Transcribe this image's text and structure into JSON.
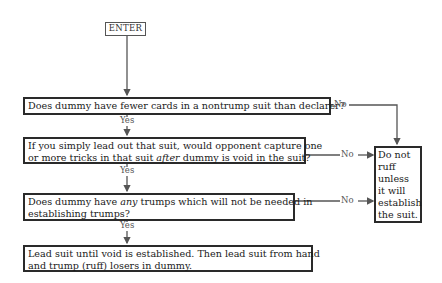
{
  "diagram": {
    "type": "flowchart",
    "start": {
      "label": "ENTER"
    },
    "nodes": [
      {
        "id": "q1",
        "type": "decision",
        "line1": "Does dummy have fewer cards in a nontrump suit than declarer?"
      },
      {
        "id": "q2",
        "type": "decision",
        "line1": "If you simply lead out that suit,  would opponent capture one",
        "line2_pre": "or more tricks in that suit ",
        "line2_em": "after",
        "line2_post": " dummy is void in the suit?"
      },
      {
        "id": "q3",
        "type": "decision",
        "line1_pre": "Does dummy have ",
        "line1_em": "any",
        "line1_post": " trumps which will not be needed in",
        "line2": "establishing trumps?"
      },
      {
        "id": "a1",
        "type": "action",
        "line1": "Lead suit until void is established.   Then lead suit from hand",
        "line2": "and trump (ruff) losers in dummy."
      },
      {
        "id": "a2",
        "type": "action",
        "lines": [
          "Do not",
          "ruff",
          "unless",
          "it will",
          "establish",
          "the suit."
        ]
      }
    ],
    "edges": [
      {
        "from": "ENTER",
        "to": "q1",
        "label": ""
      },
      {
        "from": "q1",
        "to": "q2",
        "label": "Yes"
      },
      {
        "from": "q1",
        "to": "a2",
        "label": "No"
      },
      {
        "from": "q2",
        "to": "q3",
        "label": "Yes"
      },
      {
        "from": "q2",
        "to": "a2",
        "label": "No"
      },
      {
        "from": "q3",
        "to": "a1",
        "label": "Yes"
      },
      {
        "from": "q3",
        "to": "a2",
        "label": "No"
      }
    ],
    "labels": {
      "yes": "Yes",
      "no": "No"
    }
  }
}
